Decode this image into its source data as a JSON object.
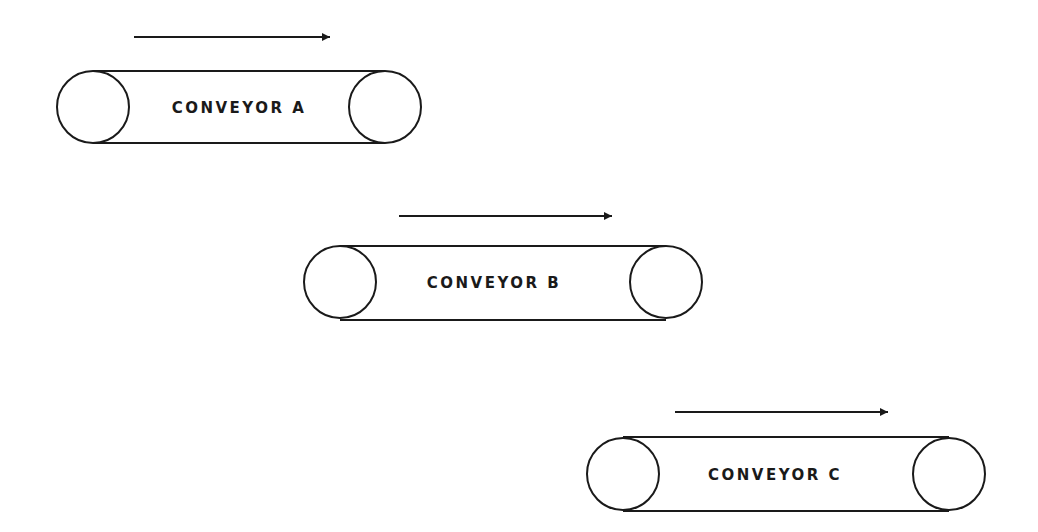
{
  "diagram": {
    "stroke_color": "#1a1a1a",
    "background": "#ffffff",
    "conveyors": [
      {
        "label": "CONVEYOR A",
        "left_pulley": {
          "cx": 93,
          "cy": 107,
          "r": 36
        },
        "right_pulley": {
          "cx": 385,
          "cy": 107,
          "r": 36
        },
        "arrow": {
          "x1": 134,
          "x2": 330,
          "y": 37,
          "direction": "right"
        }
      },
      {
        "label": "CONVEYOR B",
        "left_pulley": {
          "cx": 340,
          "cy": 282,
          "r": 36
        },
        "right_pulley": {
          "cx": 666,
          "cy": 282,
          "r": 36
        },
        "arrow": {
          "x1": 399,
          "x2": 612,
          "y": 216,
          "direction": "right"
        }
      },
      {
        "label": "CONVEYOR C",
        "left_pulley": {
          "cx": 623,
          "cy": 474,
          "r": 36
        },
        "right_pulley": {
          "cx": 949,
          "cy": 474,
          "r": 36
        },
        "arrow": {
          "x1": 675,
          "x2": 888,
          "y": 412,
          "direction": "right"
        }
      }
    ]
  }
}
